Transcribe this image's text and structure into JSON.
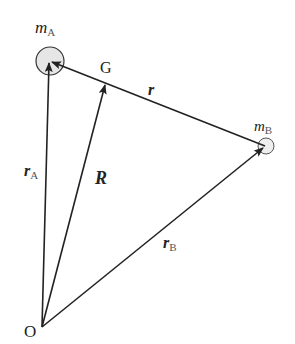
{
  "diagram": {
    "type": "vector-diagram",
    "points": {
      "O": {
        "label": "O",
        "x": 42,
        "y": 327
      },
      "A": {
        "label": "m",
        "subscript": "A",
        "x": 50,
        "y": 61,
        "radius": 14
      },
      "B": {
        "label": "m",
        "subscript": "B",
        "x": 265,
        "y": 146,
        "radius": 8
      },
      "G": {
        "label": "G",
        "x": 106,
        "y": 83
      }
    },
    "vectors": [
      {
        "name": "r_A",
        "label": "r",
        "subscript": "A",
        "from": "O",
        "to": "A"
      },
      {
        "name": "R",
        "label": "R",
        "subscript": "",
        "from": "O",
        "to": "G"
      },
      {
        "name": "r_B",
        "label": "r",
        "subscript": "B",
        "from": "O",
        "to": "B"
      },
      {
        "name": "r",
        "label": "r",
        "subscript": "",
        "from": "B",
        "to": "A"
      }
    ],
    "colors": {
      "line": "#222222",
      "particle_fill": "#e6e6e6",
      "background": "#ffffff"
    }
  }
}
